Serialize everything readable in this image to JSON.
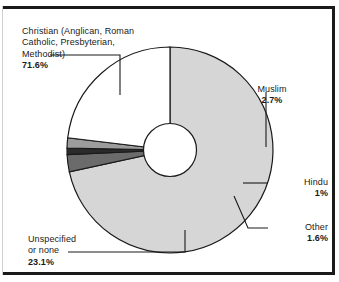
{
  "figure": {
    "background_color": "#ffffff",
    "border_color": "#1a1a1a"
  },
  "chart_data": {
    "type": "pie",
    "title": "",
    "subtitle": "",
    "xlabel": "",
    "ylabel": "",
    "legend_position": "none",
    "grid": false,
    "donut": true,
    "donut_hole_ratio": 0.28,
    "start_angle_deg": 0,
    "direction": "clockwise",
    "categories": [
      "Christian (Anglican, Roman Catholic, Presbyterian, Methodist)",
      "Muslim",
      "Hindu",
      "Other",
      "Unspecified or none"
    ],
    "values": [
      71.6,
      2.7,
      1.0,
      1.6,
      23.1
    ],
    "value_labels": [
      "71.6%",
      "2.7%",
      "1%",
      "1.6%",
      "23.1%"
    ],
    "colors": [
      "#d6d6d6",
      "#6b6b6b",
      "#2b2b2b",
      "#9c9c9c",
      "#ffffff"
    ],
    "slice_edge_color": "#1a1a1a",
    "units": "percent"
  },
  "callouts": {
    "christian": {
      "name": "Christian (Anglican, Roman\nCatholic, Presbyterian,\nMethodist)",
      "percent": "71.6%"
    },
    "muslim": {
      "name": "Muslim",
      "percent": "2.7%"
    },
    "hindu": {
      "name": "Hindu",
      "percent": "1%"
    },
    "other": {
      "name": "Other",
      "percent": "1.6%"
    },
    "unspecified": {
      "name": "Unspecified\nor none",
      "percent": "23.1%"
    }
  }
}
